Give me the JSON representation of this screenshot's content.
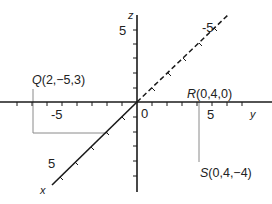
{
  "diagram": {
    "type": "3d-coordinate-axes",
    "axes": {
      "x": {
        "name": "x",
        "tick_label": "5",
        "back_tick_label": "-5"
      },
      "y": {
        "name": "y",
        "tick_neg_label": "-5",
        "tick_pos_label": "5"
      },
      "z": {
        "name": "z",
        "tick_label": "5"
      }
    },
    "origin_label": "0",
    "points": [
      {
        "letter": "Q",
        "coords": "(2,−5,3)"
      },
      {
        "letter": "R",
        "coords": "(0,4,0)"
      },
      {
        "letter": "S",
        "coords": "(0,4,−4)"
      }
    ],
    "colors": {
      "axis": "#1a1a1a",
      "construction": "#888888",
      "background": "#ffffff"
    }
  }
}
